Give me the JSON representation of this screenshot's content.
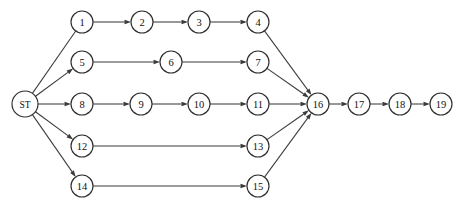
{
  "diagram": {
    "type": "directed-graph",
    "background_color": "#ffffff",
    "node_fill_color": "#ffffff",
    "node_stroke_color": "#2e2e2e",
    "edge_color": "#3a3a3a",
    "label_color": "#111111",
    "node_radius": 11,
    "start_node_radius": 13,
    "arrow_length": 6.5,
    "arrow_width": 4.4,
    "nodes": [
      {
        "id": "ST",
        "label": "ST",
        "x": 25,
        "y": 104,
        "r": 13,
        "kind": "start"
      },
      {
        "id": "1",
        "label": "1",
        "x": 82,
        "y": 22,
        "r": 11,
        "kind": "task"
      },
      {
        "id": "2",
        "label": "2",
        "x": 142,
        "y": 22,
        "r": 11,
        "kind": "task"
      },
      {
        "id": "3",
        "label": "3",
        "x": 199,
        "y": 22,
        "r": 11,
        "kind": "task"
      },
      {
        "id": "4",
        "label": "4",
        "x": 258,
        "y": 22,
        "r": 11,
        "kind": "task"
      },
      {
        "id": "5",
        "label": "5",
        "x": 82,
        "y": 62,
        "r": 11,
        "kind": "task"
      },
      {
        "id": "6",
        "label": "6",
        "x": 171,
        "y": 62,
        "r": 11,
        "kind": "task"
      },
      {
        "id": "7",
        "label": "7",
        "x": 258,
        "y": 62,
        "r": 11,
        "kind": "task"
      },
      {
        "id": "8",
        "label": "8",
        "x": 82,
        "y": 104,
        "r": 11,
        "kind": "task"
      },
      {
        "id": "9",
        "label": "9",
        "x": 141,
        "y": 104,
        "r": 11,
        "kind": "task"
      },
      {
        "id": "10",
        "label": "10",
        "x": 199,
        "y": 104,
        "r": 11,
        "kind": "task"
      },
      {
        "id": "11",
        "label": "11",
        "x": 258,
        "y": 104,
        "r": 11,
        "kind": "task"
      },
      {
        "id": "12",
        "label": "12",
        "x": 82,
        "y": 146,
        "r": 11,
        "kind": "task"
      },
      {
        "id": "13",
        "label": "13",
        "x": 258,
        "y": 146,
        "r": 11,
        "kind": "task"
      },
      {
        "id": "14",
        "label": "14",
        "x": 82,
        "y": 186,
        "r": 11,
        "kind": "task"
      },
      {
        "id": "15",
        "label": "15",
        "x": 258,
        "y": 186,
        "r": 11,
        "kind": "task"
      },
      {
        "id": "16",
        "label": "16",
        "x": 318,
        "y": 104,
        "r": 11,
        "kind": "merge"
      },
      {
        "id": "17",
        "label": "17",
        "x": 359,
        "y": 104,
        "r": 11,
        "kind": "task"
      },
      {
        "id": "18",
        "label": "18",
        "x": 400,
        "y": 104,
        "r": 11,
        "kind": "task"
      },
      {
        "id": "19",
        "label": "19",
        "x": 441,
        "y": 104,
        "r": 11,
        "kind": "end"
      }
    ],
    "edges": [
      {
        "from": "ST",
        "to": "1",
        "arrow": false
      },
      {
        "from": "ST",
        "to": "5",
        "arrow": true
      },
      {
        "from": "ST",
        "to": "8",
        "arrow": true
      },
      {
        "from": "ST",
        "to": "12",
        "arrow": true
      },
      {
        "from": "ST",
        "to": "14",
        "arrow": true
      },
      {
        "from": "1",
        "to": "2",
        "arrow": true
      },
      {
        "from": "2",
        "to": "3",
        "arrow": true
      },
      {
        "from": "3",
        "to": "4",
        "arrow": true
      },
      {
        "from": "5",
        "to": "6",
        "arrow": true
      },
      {
        "from": "6",
        "to": "7",
        "arrow": true
      },
      {
        "from": "8",
        "to": "9",
        "arrow": true
      },
      {
        "from": "9",
        "to": "10",
        "arrow": true
      },
      {
        "from": "10",
        "to": "11",
        "arrow": true
      },
      {
        "from": "12",
        "to": "13",
        "arrow": true
      },
      {
        "from": "14",
        "to": "15",
        "arrow": true
      },
      {
        "from": "4",
        "to": "16",
        "arrow": true
      },
      {
        "from": "7",
        "to": "16",
        "arrow": true
      },
      {
        "from": "11",
        "to": "16",
        "arrow": true
      },
      {
        "from": "13",
        "to": "16",
        "arrow": true
      },
      {
        "from": "15",
        "to": "16",
        "arrow": true
      },
      {
        "from": "16",
        "to": "17",
        "arrow": true
      },
      {
        "from": "17",
        "to": "18",
        "arrow": true
      },
      {
        "from": "18",
        "to": "19",
        "arrow": true
      }
    ]
  }
}
